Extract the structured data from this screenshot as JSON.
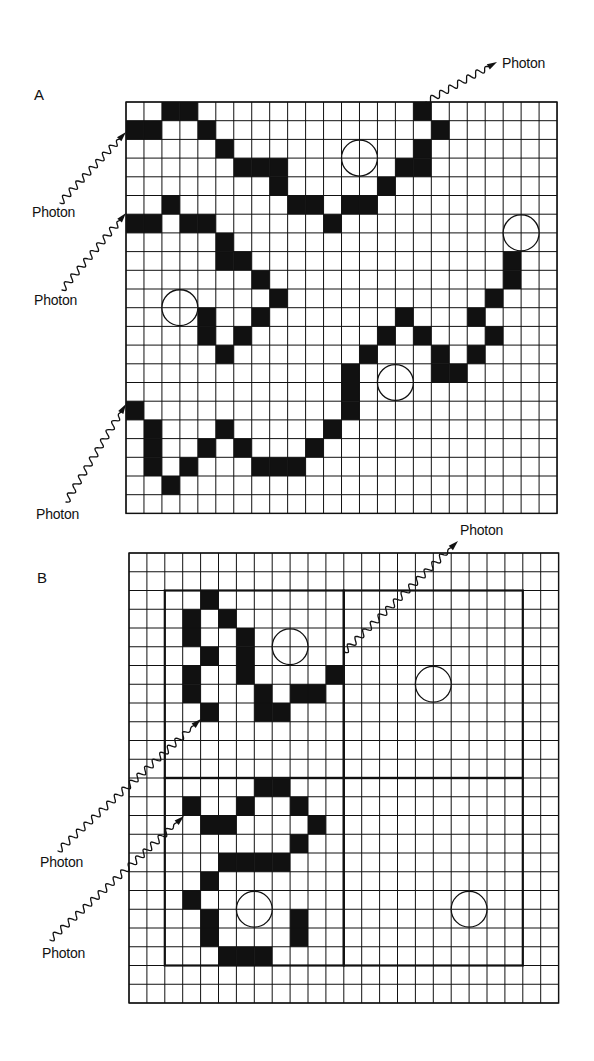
{
  "colors": {
    "ink": "#111111",
    "paper": "#ffffff",
    "cell_fill": "#111111"
  },
  "panels": [
    {
      "id": "A",
      "label": "A",
      "label_pos": [
        34,
        86
      ],
      "grid": {
        "x": 126,
        "y": 102,
        "cols": 24,
        "rows": 22,
        "cell_w": 17.96,
        "cell_h": 18.7
      },
      "filled_cells": [
        [
          0,
          2
        ],
        [
          0,
          3
        ],
        [
          0,
          16
        ],
        [
          1,
          0
        ],
        [
          1,
          1
        ],
        [
          1,
          4
        ],
        [
          1,
          17
        ],
        [
          2,
          5
        ],
        [
          2,
          16
        ],
        [
          3,
          6
        ],
        [
          3,
          7
        ],
        [
          3,
          8
        ],
        [
          3,
          15
        ],
        [
          3,
          16
        ],
        [
          4,
          8
        ],
        [
          4,
          14
        ],
        [
          5,
          2
        ],
        [
          5,
          9
        ],
        [
          5,
          10
        ],
        [
          5,
          12
        ],
        [
          5,
          13
        ],
        [
          6,
          0
        ],
        [
          6,
          1
        ],
        [
          6,
          3
        ],
        [
          6,
          4
        ],
        [
          6,
          11
        ],
        [
          7,
          5
        ],
        [
          8,
          5
        ],
        [
          8,
          6
        ],
        [
          8,
          21
        ],
        [
          9,
          7
        ],
        [
          9,
          21
        ],
        [
          10,
          8
        ],
        [
          10,
          20
        ],
        [
          11,
          4
        ],
        [
          11,
          7
        ],
        [
          11,
          15
        ],
        [
          11,
          19
        ],
        [
          12,
          4
        ],
        [
          12,
          6
        ],
        [
          12,
          14
        ],
        [
          12,
          16
        ],
        [
          12,
          20
        ],
        [
          13,
          5
        ],
        [
          13,
          13
        ],
        [
          13,
          17
        ],
        [
          13,
          19
        ],
        [
          14,
          12
        ],
        [
          14,
          17
        ],
        [
          14,
          18
        ],
        [
          15,
          12
        ],
        [
          16,
          0
        ],
        [
          16,
          12
        ],
        [
          17,
          1
        ],
        [
          17,
          5
        ],
        [
          17,
          11
        ],
        [
          18,
          1
        ],
        [
          18,
          4
        ],
        [
          18,
          6
        ],
        [
          18,
          10
        ],
        [
          19,
          1
        ],
        [
          19,
          3
        ],
        [
          19,
          7
        ],
        [
          19,
          8
        ],
        [
          19,
          9
        ],
        [
          20,
          2
        ]
      ],
      "circles": [
        {
          "col_line": 13,
          "row_line": 3,
          "r_cells": 1
        },
        {
          "col_line": 22,
          "row_line": 7,
          "r_cells": 1
        },
        {
          "col_line": 3,
          "row_line": 11,
          "r_cells": 1
        },
        {
          "col_line": 15,
          "row_line": 15,
          "r_cells": 1
        }
      ],
      "boxes": [],
      "photons": [
        {
          "label": "Photon",
          "label_pos": [
            32,
            204
          ],
          "from": [
            60,
            203
          ],
          "to": [
            126,
            132
          ],
          "direction": "incoming"
        },
        {
          "label": "Photon",
          "label_pos": [
            34,
            292
          ],
          "from": [
            62,
            290
          ],
          "to": [
            126,
            213
          ],
          "direction": "incoming"
        },
        {
          "label": "Photon",
          "label_pos": [
            36,
            506
          ],
          "from": [
            66,
            502
          ],
          "to": [
            126,
            404
          ],
          "direction": "incoming"
        },
        {
          "label": "Photon",
          "label_pos": [
            502,
            55
          ],
          "from": [
            426,
            102
          ],
          "to": [
            497,
            62
          ],
          "direction": "outgoing"
        }
      ]
    },
    {
      "id": "B",
      "label": "B",
      "label_pos": [
        37,
        569
      ],
      "grid": {
        "x": 129,
        "y": 553,
        "cols": 24,
        "rows": 24,
        "cell_w": 17.9,
        "cell_h": 18.75
      },
      "filled_cells": [
        [
          2,
          4
        ],
        [
          3,
          3
        ],
        [
          3,
          5
        ],
        [
          4,
          3
        ],
        [
          4,
          6
        ],
        [
          5,
          4
        ],
        [
          5,
          6
        ],
        [
          6,
          3
        ],
        [
          6,
          6
        ],
        [
          6,
          11
        ],
        [
          7,
          3
        ],
        [
          7,
          7
        ],
        [
          7,
          9
        ],
        [
          7,
          10
        ],
        [
          8,
          4
        ],
        [
          8,
          7
        ],
        [
          8,
          8
        ],
        [
          12,
          7
        ],
        [
          12,
          8
        ],
        [
          13,
          3
        ],
        [
          13,
          6
        ],
        [
          13,
          9
        ],
        [
          14,
          4
        ],
        [
          14,
          5
        ],
        [
          14,
          10
        ],
        [
          15,
          9
        ],
        [
          16,
          5
        ],
        [
          16,
          6
        ],
        [
          16,
          7
        ],
        [
          16,
          8
        ],
        [
          17,
          4
        ],
        [
          18,
          3
        ],
        [
          19,
          4
        ],
        [
          19,
          9
        ],
        [
          20,
          4
        ],
        [
          20,
          9
        ],
        [
          21,
          5
        ],
        [
          21,
          6
        ],
        [
          21,
          7
        ]
      ],
      "circles": [
        {
          "col_line": 9,
          "row_line": 5,
          "r_cells": 1
        },
        {
          "col_line": 17,
          "row_line": 7,
          "r_cells": 1
        },
        {
          "col_line": 7,
          "row_line": 19,
          "r_cells": 1
        },
        {
          "col_line": 19,
          "row_line": 19,
          "r_cells": 1
        }
      ],
      "boxes": [
        {
          "col0": 2,
          "row0": 2,
          "col1": 12,
          "row1": 12
        },
        {
          "col0": 12,
          "row0": 2,
          "col1": 22,
          "row1": 12
        },
        {
          "col0": 2,
          "row0": 12,
          "col1": 12,
          "row1": 22
        },
        {
          "col0": 12,
          "row0": 12,
          "col1": 22,
          "row1": 22
        }
      ],
      "photons": [
        {
          "label": "Photon",
          "label_pos": [
            460,
            522
          ],
          "from": [
            344,
            652
          ],
          "to": [
            458,
            541
          ],
          "direction": "outgoing"
        },
        {
          "label": "Photon",
          "label_pos": [
            40,
            854
          ],
          "from": [
            58,
            851
          ],
          "to": [
            201,
            719
          ],
          "direction": "incoming"
        },
        {
          "label": "Photon",
          "label_pos": [
            42,
            945
          ],
          "from": [
            50,
            940
          ],
          "to": [
            184,
            816
          ],
          "direction": "incoming"
        }
      ]
    }
  ]
}
